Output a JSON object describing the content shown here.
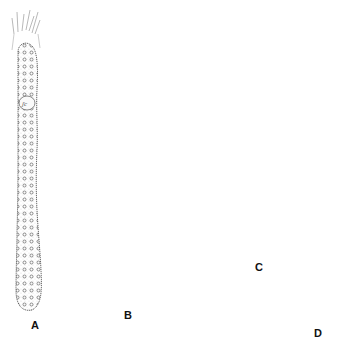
{
  "figure": {
    "type": "scientific-illustration",
    "background": "#ffffff",
    "ink_color": "#222222",
    "panels": [
      {
        "id": "A",
        "label": "A",
        "description": "elongated cylindrical cell with apical tuft and granular interior",
        "label_pos": [
          31,
          320
        ]
      },
      {
        "id": "B",
        "label": "B",
        "description": "columnar mass of dense granules surrounded by rounded bulbous vesicles",
        "label_pos": [
          124,
          310
        ]
      },
      {
        "id": "C",
        "label": "C",
        "description": "dumbbell-shaped dividing body with circular inclusions",
        "label_pos": [
          255,
          263
        ]
      },
      {
        "id": "D",
        "label": "D",
        "description": "flask-shaped cell with lobed ruffled top, three encapsulated bodies and a long tapering tail",
        "label_pos": [
          314,
          328
        ]
      }
    ]
  }
}
